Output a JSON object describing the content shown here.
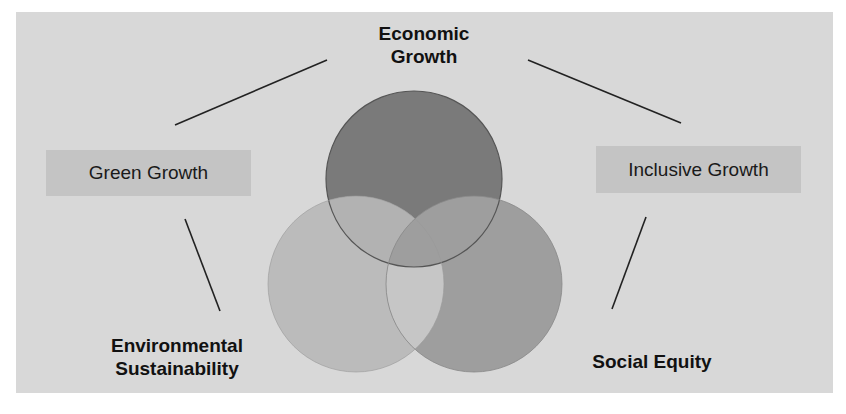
{
  "diagram": {
    "type": "venn",
    "circles": [
      {
        "name": "Economic Growth",
        "label": "Economic\nGrowth",
        "line1": "Economic",
        "line2": "Growth",
        "color": "#7a7a7a"
      },
      {
        "name": "Environmental Sustainability",
        "line1": "Environmental",
        "line2": "Sustainability",
        "color": "#b6b6b6"
      },
      {
        "name": "Social Equity",
        "line1": "Social Equity",
        "color": "#9a9a9a"
      }
    ],
    "connectors": [
      {
        "label": "Green Growth",
        "links": [
          "Economic Growth",
          "Environmental Sustainability"
        ]
      },
      {
        "label": "Inclusive Growth",
        "links": [
          "Economic Growth",
          "Social Equity"
        ]
      }
    ]
  },
  "labels": {
    "economic_line1": "Economic",
    "economic_line2": "Growth",
    "environmental_line1": "Environmental",
    "environmental_line2": "Sustainability",
    "social": "Social Equity",
    "green_growth": "Green Growth",
    "inclusive_growth": "Inclusive Growth"
  }
}
